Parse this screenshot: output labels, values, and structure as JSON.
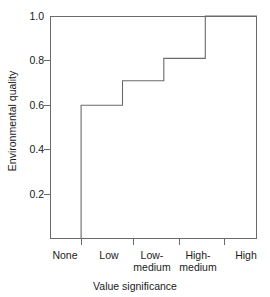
{
  "chart_data": {
    "type": "line",
    "subtype": "step",
    "title": "",
    "xlabel": "Value significance",
    "ylabel": "Environmental quality",
    "categories": [
      "None",
      "Low",
      "Low-medium",
      "High-medium",
      "High"
    ],
    "values": [
      0.0,
      0.6,
      0.71,
      0.81,
      1.0
    ],
    "step_mode": "post-riser-at-category",
    "series": [
      {
        "name": "Environmental quality",
        "values": [
          0.0,
          0.6,
          0.71,
          0.81,
          1.0
        ]
      }
    ],
    "yticks": [
      "0.2",
      "0.4",
      "0.6",
      "0.8",
      "1.0"
    ],
    "ytick_values": [
      0.2,
      0.4,
      0.6,
      0.8,
      1.0
    ],
    "ylim": [
      0.0,
      1.0
    ],
    "xlim": [
      0,
      5
    ],
    "grid": false,
    "legend": false,
    "line_color": "#6a6a6a",
    "frame_color": "#6a6a6a",
    "background": "#ffffff"
  },
  "axes": {
    "y_title": "Environmental quality",
    "x_title": "Value significance",
    "y_tick_labels": [
      "1.0",
      "0.8",
      "0.6",
      "0.4",
      "0.2"
    ],
    "x_tick_labels": [
      {
        "line1": "None",
        "line2": ""
      },
      {
        "line1": "Low",
        "line2": ""
      },
      {
        "line1": "Low-",
        "line2": "medium"
      },
      {
        "line1": "High-",
        "line2": "medium"
      },
      {
        "line1": "High",
        "line2": ""
      }
    ]
  }
}
